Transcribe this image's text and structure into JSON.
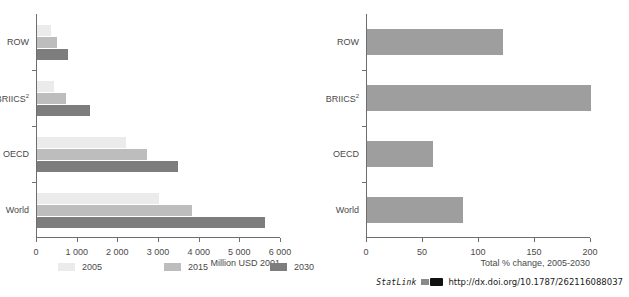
{
  "chart_data": [
    {
      "type": "bar",
      "orientation": "horizontal",
      "panel": "left",
      "title": "",
      "xlabel": "Million USD 2001",
      "ylabel": "",
      "categories": [
        "ROW",
        "BRIICS²",
        "OECD",
        "World"
      ],
      "category_plain": [
        "ROW",
        "BRIICS2",
        "OECD",
        "World"
      ],
      "series": [
        {
          "name": "2005",
          "color": "#ebebeb",
          "values": [
            340,
            430,
            2180,
            3000
          ]
        },
        {
          "name": "2015",
          "color": "#bdbdbd",
          "values": [
            490,
            720,
            2700,
            3800
          ]
        },
        {
          "name": "2030",
          "color": "#7d7d7d",
          "values": [
            770,
            1310,
            3470,
            5600
          ]
        }
      ],
      "xlim": [
        0,
        6000
      ],
      "xticks": [
        0,
        1000,
        2000,
        3000,
        4000,
        5000,
        6000
      ],
      "xticklabels": [
        "0",
        "1 000",
        "2 000",
        "3 000",
        "4 000",
        "5 000",
        "6 000"
      ],
      "grid": false,
      "legend_position": "bottom"
    },
    {
      "type": "bar",
      "orientation": "horizontal",
      "panel": "right",
      "title": "",
      "xlabel": "Total % change, 2005-2030",
      "ylabel": "",
      "categories": [
        "ROW",
        "BRIICS²",
        "OECD",
        "World"
      ],
      "category_plain": [
        "ROW",
        "BRIICS2",
        "OECD",
        "World"
      ],
      "series": [
        {
          "name": "Total % change, 2005-2030",
          "color": "#9e9e9e",
          "values": [
            121,
            200,
            59,
            86
          ]
        }
      ],
      "xlim": [
        0,
        200
      ],
      "xticks": [
        0,
        50,
        100,
        150,
        200
      ],
      "xticklabels": [
        "0",
        "50",
        "100",
        "150",
        "200"
      ],
      "grid": false,
      "legend_position": "none"
    }
  ],
  "legend": {
    "items": [
      {
        "label": "2005",
        "color": "#ebebeb"
      },
      {
        "label": "2015",
        "color": "#bdbdbd"
      },
      {
        "label": "2030",
        "color": "#7d7d7d"
      }
    ]
  },
  "footer": {
    "statlink_label": "StatLink",
    "statlink_icon": "statlink-barcode-icon",
    "url": "http://dx.doi.org/10.1787/262116088037"
  }
}
